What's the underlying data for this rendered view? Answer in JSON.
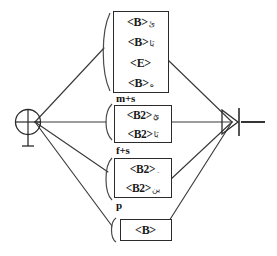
{
  "diagram": {
    "stroke_color": "#2b2b2b",
    "text_color": "#1a1a1a",
    "background": "#ffffff",
    "start_node": {
      "name": "start-node",
      "symbol": "circle-plus"
    },
    "end_node": {
      "name": "end-node",
      "symbol": "arrowhead-bar"
    }
  },
  "groups": [
    {
      "id": "group-top",
      "label": "",
      "label_visible": false,
      "entries": [
        {
          "token": "<B>",
          "mark": "ئ"
        },
        {
          "token": "<B>",
          "mark": "يَا"
        },
        {
          "token": "<E>",
          "mark": ""
        },
        {
          "token": "<B>",
          "mark": "ه"
        }
      ]
    },
    {
      "id": "group-ms",
      "label": "m+s",
      "label_visible": true,
      "entries": [
        {
          "token": "<B2>",
          "mark": "يُ"
        },
        {
          "token": "<B2>",
          "mark": "يَا"
        }
      ]
    },
    {
      "id": "group-fs",
      "label": "f+s",
      "label_visible": true,
      "entries": [
        {
          "token": "<B2>",
          "mark": "ِ"
        },
        {
          "token": "<B2>",
          "mark": "ين"
        }
      ]
    },
    {
      "id": "group-p",
      "label": "p",
      "label_visible": true,
      "entries": [
        {
          "token": "<B>",
          "mark": ""
        }
      ]
    }
  ]
}
